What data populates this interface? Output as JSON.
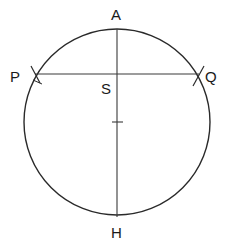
{
  "diagram": {
    "type": "circle-construction",
    "stroke_color": "#2a2a2a",
    "circle": {
      "cx": 117,
      "cy": 122,
      "r": 93
    },
    "points": {
      "A": {
        "label": "A",
        "x": 117,
        "y": 29
      },
      "H": {
        "label": "H",
        "x": 117,
        "y": 215
      },
      "P": {
        "label": "P",
        "x": 35,
        "y": 74
      },
      "Q": {
        "label": "Q",
        "x": 199,
        "y": 74
      },
      "S": {
        "label": "S",
        "x": 117,
        "y": 74
      }
    },
    "segments": [
      {
        "name": "diameter-AH",
        "from": "A",
        "to": "H"
      },
      {
        "name": "chord-PQ",
        "from": "P",
        "to": "Q"
      }
    ],
    "center_tick": {
      "x": 117,
      "y": 122
    }
  }
}
